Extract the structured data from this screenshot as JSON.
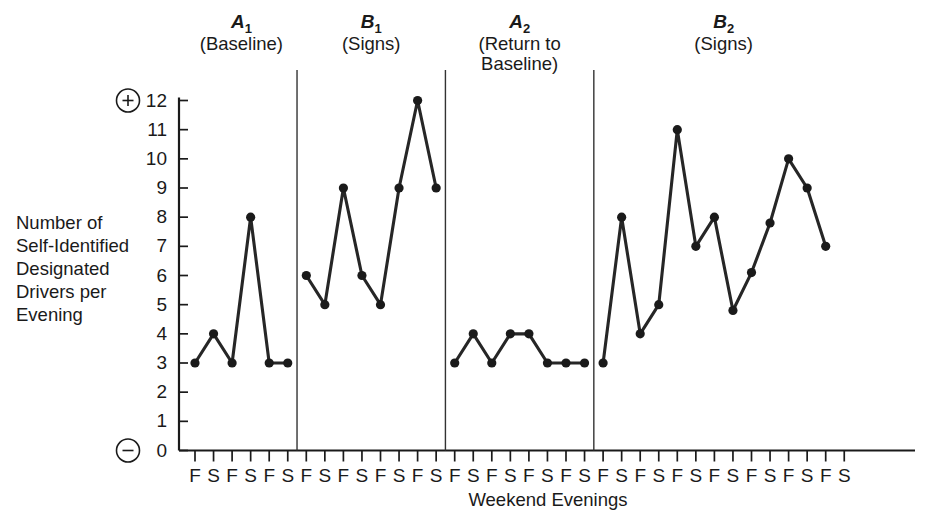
{
  "chart_data": {
    "type": "line",
    "title": "",
    "xlabel": "Weekend Evenings",
    "ylabel_lines": [
      "Number of",
      "Self-Identified",
      "Designated",
      "Drivers per",
      "Evening"
    ],
    "ylim": [
      0,
      12
    ],
    "ytick_labels": [
      "0",
      "1",
      "2",
      "3",
      "4",
      "5",
      "6",
      "7",
      "8",
      "9",
      "10",
      "11",
      "12"
    ],
    "yticks": [
      0,
      1,
      2,
      3,
      4,
      5,
      6,
      7,
      8,
      9,
      10,
      11,
      12
    ],
    "grid": false,
    "legend": "none",
    "positive_marker": "+",
    "negative_marker": "−",
    "phases": [
      {
        "id": "A1",
        "letter": "A",
        "subscript": "1",
        "condition_lines": [
          "(Baseline)"
        ],
        "xtick_labels": [
          "F",
          "S",
          "F",
          "S",
          "F",
          "S"
        ],
        "values": [
          3,
          4,
          3,
          8,
          3,
          3
        ]
      },
      {
        "id": "B1",
        "letter": "B",
        "subscript": "1",
        "condition_lines": [
          "(Signs)"
        ],
        "xtick_labels": [
          "F",
          "S",
          "F",
          "S",
          "F",
          "S",
          "F",
          "S"
        ],
        "values": [
          6,
          5,
          9,
          6,
          5,
          9,
          12,
          9
        ]
      },
      {
        "id": "A2",
        "letter": "A",
        "subscript": "2",
        "condition_lines": [
          "(Return to",
          "Baseline)"
        ],
        "xtick_labels": [
          "F",
          "S",
          "F",
          "S",
          "F",
          "S",
          "F",
          "S"
        ],
        "values": [
          3,
          4,
          3,
          4,
          4,
          3,
          3,
          3
        ]
      },
      {
        "id": "B2",
        "letter": "B",
        "subscript": "2",
        "condition_lines": [
          "(Signs)"
        ],
        "xtick_labels": [
          "F",
          "S",
          "F",
          "S",
          "F",
          "S",
          "F",
          "S",
          "F",
          "S",
          "F",
          "S",
          "F",
          "S"
        ],
        "values": [
          3,
          8,
          4,
          5,
          11,
          7,
          8,
          4.8,
          6.1,
          7.8,
          10,
          9,
          7,
          null
        ]
      }
    ],
    "colors": {
      "line": "#262626",
      "marker": "#1a1a1a",
      "axis": "#1a1a1a",
      "divider": "#333333",
      "background": "#ffffff"
    }
  }
}
